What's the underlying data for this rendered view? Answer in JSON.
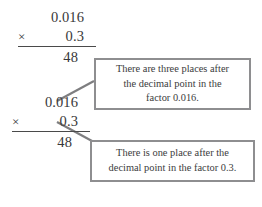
{
  "figure": {
    "background_color": "#ffffff",
    "text_color": "#3a3a3a",
    "box_border_color": "#8e8e90",
    "connector_color": "#7e7e80"
  },
  "expressions": [
    {
      "name": "top-expression",
      "factor_one": "0.016",
      "operator": "×",
      "factor_two": "0.3",
      "product": "48"
    },
    {
      "name": "bottom-expression",
      "factor_one": "0.016",
      "operator": "×",
      "factor_two": "0.3",
      "product": "48"
    }
  ],
  "callouts": [
    {
      "name": "callout-three-places",
      "lines": [
        "There are three places after",
        "the decimal point in the",
        "factor 0.016."
      ]
    },
    {
      "name": "callout-one-place",
      "lines": [
        "There is one place after the",
        "decimal point in the factor 0.3."
      ]
    }
  ]
}
